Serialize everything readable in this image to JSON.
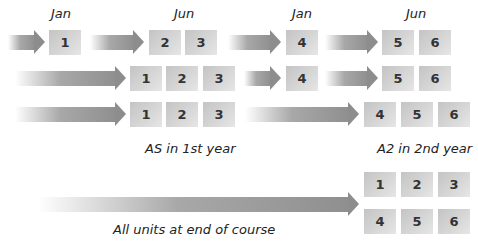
{
  "headers": {
    "jan1": "Jan",
    "jun1": "Jun",
    "jan2": "Jan",
    "jun2": "Jun"
  },
  "rows": [
    {
      "name": "row1-staged",
      "units": [
        "1",
        "2",
        "3",
        "4",
        "5",
        "6"
      ]
    },
    {
      "name": "row2-staged",
      "units": [
        "1",
        "2",
        "3",
        "4",
        "5",
        "6"
      ]
    },
    {
      "name": "row3-yearly",
      "units": [
        "1",
        "2",
        "3",
        "4",
        "5",
        "6"
      ]
    },
    {
      "name": "row4-linear",
      "units": [
        "1",
        "2",
        "3",
        "4",
        "5",
        "6"
      ]
    }
  ],
  "labels": {
    "as_first_year": "AS in 1st year",
    "a2_second_year": "A2 in 2nd year",
    "all_units_end": "All units at end of course"
  },
  "colors": {
    "box": "#d0d0d0",
    "arrow": "#8d8d8d",
    "text": "#222222"
  }
}
